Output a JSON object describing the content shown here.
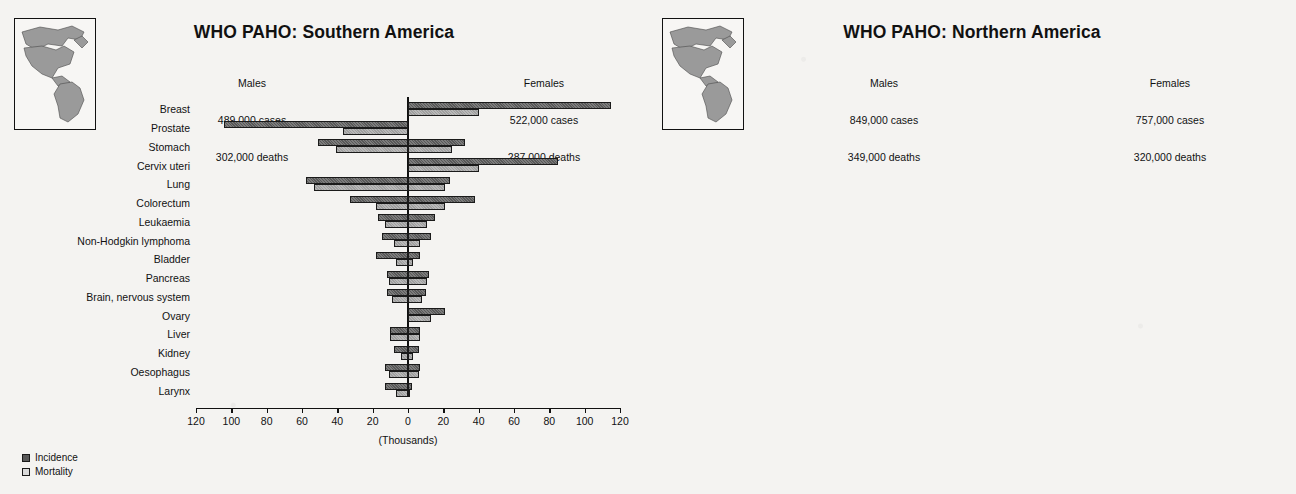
{
  "legend": {
    "incidence_label": "Incidence",
    "mortality_label": "Mortality",
    "incidence_color": "#585858",
    "mortality_color": "#d9d9d9"
  },
  "axis_title": "(Thousands)",
  "panels": [
    {
      "id": "left",
      "title": "WHO PAHO: Southern America",
      "map_name": "americas-map-southern-highlight",
      "males": {
        "heading": "Males",
        "cases": "489,000 cases",
        "deaths": "302,000 deaths"
      },
      "females": {
        "heading": "Females",
        "cases": "522,000 cases",
        "deaths": "287,000 deaths"
      }
    },
    {
      "id": "right",
      "title": "WHO PAHO: Northern America",
      "map_name": "americas-map-northern-highlight",
      "males": {
        "heading": "Males",
        "cases": "849,000 cases",
        "deaths": "349,000 deaths"
      },
      "females": {
        "heading": "Females",
        "cases": "757,000 cases",
        "deaths": "320,000 deaths"
      }
    }
  ],
  "chart_data": [
    {
      "type": "bar",
      "orientation": "horizontal-pyramid",
      "title": "WHO PAHO: Southern America",
      "xlabel": "(Thousands)",
      "ylabel": "",
      "xlim": [
        -120,
        120
      ],
      "ticks": [
        120,
        100,
        80,
        60,
        40,
        20,
        0,
        20,
        40,
        60,
        80,
        100,
        120
      ],
      "grid": false,
      "legend_position": "bottom-left",
      "categories": [
        "Breast",
        "Prostate",
        "Stomach",
        "Cervix uteri",
        "Lung",
        "Colorectum",
        "Leukaemia",
        "Non-Hodgkin lymphoma",
        "Bladder",
        "Pancreas",
        "Brain, nervous system",
        "Ovary",
        "Liver",
        "Kidney",
        "Oesophagus",
        "Larynx"
      ],
      "series": [
        {
          "name": "Male incidence",
          "side": "left",
          "metric": "incidence",
          "values": [
            0,
            104,
            51,
            0,
            58,
            33,
            17,
            15,
            18,
            12,
            12,
            0,
            10,
            8,
            13,
            13
          ]
        },
        {
          "name": "Male mortality",
          "side": "left",
          "metric": "mortality",
          "values": [
            0,
            37,
            41,
            0,
            53,
            18,
            13,
            8,
            7,
            11,
            9,
            0,
            10,
            4,
            11,
            7
          ]
        },
        {
          "name": "Female incidence",
          "side": "right",
          "metric": "incidence",
          "values": [
            115,
            0,
            32,
            85,
            24,
            38,
            15,
            13,
            7,
            12,
            10,
            21,
            7,
            6,
            7,
            2
          ]
        },
        {
          "name": "Female mortality",
          "side": "right",
          "metric": "mortality",
          "values": [
            40,
            0,
            25,
            40,
            21,
            21,
            11,
            7,
            3,
            11,
            8,
            13,
            7,
            3,
            6,
            1
          ]
        }
      ]
    },
    {
      "type": "bar",
      "orientation": "horizontal-pyramid",
      "title": "WHO PAHO: Northern America",
      "xlabel": "(Thousands)",
      "ylabel": "",
      "xlim": [
        -250,
        250
      ],
      "ticks": [
        250,
        200,
        150,
        100,
        50,
        0,
        50,
        100,
        150,
        200,
        250
      ],
      "grid": false,
      "legend_position": "bottom-left",
      "categories": [
        "Prostate",
        "Lung",
        "Breast",
        "Colorectum",
        "Bladder",
        "Non-Hodgkin lymphoma",
        "Melanoma of skin",
        "Kidney",
        "Leukaemia",
        "Corpus uteri",
        "Pancreas",
        "Thyroid",
        "Stomach",
        "Ovary",
        "Oral cavity",
        "Brain, nervous system"
      ],
      "series": [
        {
          "name": "Male incidence",
          "side": "left",
          "metric": "incidence",
          "values": [
            243,
            124,
            0,
            89,
            58,
            34,
            30,
            26,
            22,
            0,
            18,
            6,
            14,
            0,
            16,
            12
          ]
        },
        {
          "name": "Male mortality",
          "side": "left",
          "metric": "mortality",
          "values": [
            32,
            102,
            0,
            34,
            13,
            14,
            7,
            10,
            14,
            0,
            17,
            1,
            8,
            0,
            4,
            8
          ]
        },
        {
          "name": "Female incidence",
          "side": "right",
          "metric": "incidence",
          "values": [
            0,
            108,
            203,
            85,
            20,
            29,
            25,
            15,
            17,
            40,
            20,
            17,
            9,
            25,
            8,
            9
          ]
        },
        {
          "name": "Female mortality",
          "side": "right",
          "metric": "mortality",
          "values": [
            0,
            72,
            52,
            35,
            5,
            12,
            3,
            5,
            11,
            8,
            20,
            2,
            5,
            17,
            3,
            6
          ]
        }
      ]
    }
  ]
}
